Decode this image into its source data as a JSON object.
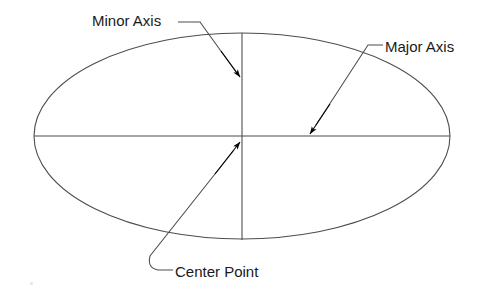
{
  "figure": {
    "background_color": "#ffffff",
    "line_color": "#4d4d4d",
    "arrow_color": "#000000",
    "text_color": "#1a1a1a"
  },
  "labels": {
    "minor_axis": "Minor Axis",
    "major_axis": "Major Axis",
    "center_point": "Center Point"
  },
  "geometry": {
    "ellipse": {
      "center_x": 242,
      "center_y": 136,
      "semi_major": 208,
      "semi_minor": 103
    },
    "major_axis_line": {
      "x1": 34,
      "y1": 136,
      "x2": 450,
      "y2": 136
    },
    "minor_axis_line": {
      "x1": 242,
      "y1": 33,
      "x2": 242,
      "y2": 240
    },
    "leaders": {
      "minor_axis": {
        "shoulder": "178,22 200,22",
        "path": "200,22 239,76",
        "arrow_tip_x": 240,
        "arrow_tip_y": 79
      },
      "major_axis": {
        "shoulder": "383,45 368,45",
        "path": "368,45 312,131",
        "arrow_tip_x": 309,
        "arrow_tip_y": 135
      },
      "center_point": {
        "shoulder": "173,270 158,270",
        "path": "158,270 150,253 239,144",
        "arrow_tip_x": 240,
        "arrow_tip_y": 141
      }
    }
  }
}
